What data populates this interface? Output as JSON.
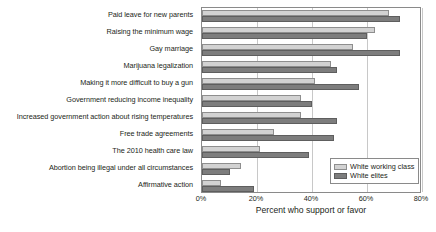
{
  "chart_data": {
    "type": "bar",
    "orientation": "horizontal",
    "title": "",
    "xlabel": "Percent who support or favor",
    "ylabel": "",
    "xlim": [
      0,
      80
    ],
    "xticks": [
      "0%",
      "20%",
      "40%",
      "60%",
      "80%"
    ],
    "xtick_values": [
      0,
      20,
      40,
      60,
      80
    ],
    "grid": "vertical",
    "legend_position": "bottom-right",
    "categories": [
      "Paid leave for new parents",
      "Raising the minimum wage",
      "Gay marriage",
      "Marijuana legalization",
      "Making it more difficult to buy a gun",
      "Government reducing income inequality",
      "Increased government action about rising temperatures",
      "Free trade agreements",
      "The 2010 health care law",
      "Abortion being illegal under all circumstances",
      "Affirmative action"
    ],
    "series": [
      {
        "name": "White working class",
        "color": "#d2d2d2",
        "values": [
          68,
          63,
          55,
          47,
          41,
          36,
          36,
          26,
          21,
          14,
          7
        ]
      },
      {
        "name": "White elites",
        "color": "#7d7d7d",
        "values": [
          72,
          60,
          72,
          49,
          57,
          40,
          49,
          48,
          39,
          10,
          19
        ]
      }
    ]
  },
  "legend": {
    "items": [
      {
        "label": "White working class",
        "swatch": "light"
      },
      {
        "label": "White elites",
        "swatch": "dark"
      }
    ]
  },
  "axis": {
    "x_title": "Percent who support or favor"
  }
}
